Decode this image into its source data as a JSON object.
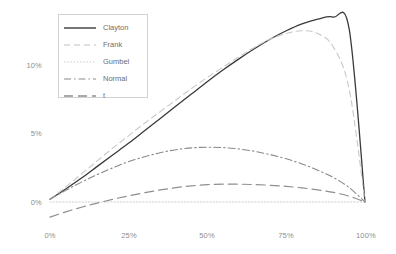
{
  "chart_data": {
    "type": "line",
    "title": "",
    "subtitle": "",
    "xlabel": "",
    "ylabel": "",
    "xlim": [
      0,
      100
    ],
    "ylim": [
      -2,
      14
    ],
    "grid": false,
    "legend_position": "top-left",
    "xticks": [
      "0%",
      "25%",
      "50%",
      "75%",
      "100%"
    ],
    "xtick_values": [
      0,
      25,
      50,
      75,
      100
    ],
    "yticks": [
      "0%",
      "5%",
      "10%"
    ],
    "ytick_values": [
      0,
      5,
      10
    ],
    "x": [
      0,
      5,
      10,
      15,
      20,
      25,
      30,
      35,
      40,
      45,
      50,
      55,
      60,
      65,
      70,
      75,
      80,
      85,
      90,
      95,
      100
    ],
    "series": [
      {
        "name": "Clayton",
        "style": "solid",
        "color": "#3a3a3a",
        "width": 1.3,
        "peak_x": 89,
        "peak_y": 13.5,
        "values": [
          0.2,
          0.95,
          1.75,
          2.6,
          3.45,
          4.3,
          5.2,
          6.1,
          7.0,
          7.9,
          8.8,
          9.65,
          10.45,
          11.2,
          11.9,
          12.5,
          13.0,
          13.35,
          13.5,
          12.6,
          0.0
        ]
      },
      {
        "name": "Frank",
        "style": "dashed",
        "color": "#c8c8c8",
        "width": 1.1,
        "peak_x": 78,
        "peak_y": 12.5,
        "values": [
          0.2,
          1.1,
          2.05,
          3.0,
          3.95,
          4.85,
          5.75,
          6.6,
          7.45,
          8.3,
          9.1,
          9.85,
          10.6,
          11.3,
          11.9,
          12.3,
          12.5,
          12.3,
          11.3,
          8.2,
          0.0
        ]
      },
      {
        "name": "Gumbel",
        "style": "dotted",
        "color": "#cfcfcf",
        "width": 1.0,
        "peak_x": 0,
        "peak_y": 0,
        "values": [
          0.0,
          0.0,
          0.0,
          0.0,
          0.0,
          0.0,
          0.0,
          0.0,
          0.0,
          0.0,
          0.0,
          0.0,
          0.0,
          0.0,
          0.0,
          0.0,
          0.0,
          0.0,
          0.0,
          0.0,
          0.0
        ]
      },
      {
        "name": "Normal",
        "style": "dashdot",
        "color": "#898989",
        "width": 1.1,
        "peak_x": 47,
        "peak_y": 4.0,
        "values": [
          0.2,
          0.85,
          1.45,
          2.0,
          2.5,
          2.95,
          3.3,
          3.6,
          3.82,
          3.95,
          4.0,
          3.97,
          3.87,
          3.7,
          3.45,
          3.15,
          2.78,
          2.32,
          1.78,
          1.05,
          0.0
        ]
      },
      {
        "name": "t",
        "style": "longdash",
        "color": "#8f8f8f",
        "width": 1.2,
        "peak_x": 53,
        "peak_y": 1.3,
        "values": [
          -1.1,
          -0.72,
          -0.38,
          -0.08,
          0.2,
          0.45,
          0.68,
          0.88,
          1.05,
          1.18,
          1.27,
          1.3,
          1.3,
          1.27,
          1.22,
          1.14,
          1.03,
          0.88,
          0.7,
          0.42,
          0.0
        ]
      }
    ]
  },
  "legend": {
    "entries": [
      {
        "label": "Clayton"
      },
      {
        "label": "Frank"
      },
      {
        "label": "Gumbel"
      },
      {
        "label": "Normal"
      },
      {
        "label": "t"
      }
    ]
  },
  "axes": {
    "y_labels": [
      "10%",
      "5%",
      "0%"
    ],
    "x_labels": [
      "0%",
      "25%",
      "50%",
      "75%",
      "100%"
    ]
  },
  "colors": {
    "background": "#ffffff",
    "tick_text": "#8e8e8e",
    "legend_text": "#6e6e6e",
    "legend_border": "#d2d2d2"
  }
}
